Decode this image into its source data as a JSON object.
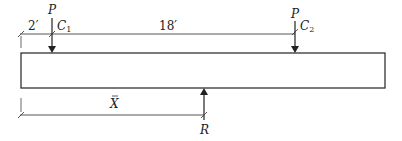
{
  "diagram": {
    "type": "beam-free-body",
    "loads": [
      {
        "id": "P1",
        "label": "P",
        "point": "C",
        "subscript": "1"
      },
      {
        "id": "P2",
        "label": "P",
        "point": "C",
        "subscript": "2"
      }
    ],
    "reaction": {
      "label": "R"
    },
    "dimensions": {
      "left_offset": "2′",
      "between_loads": "18′",
      "resultant_distance": "X"
    },
    "colors": {
      "line": "#333333",
      "background": "#ffffff"
    }
  }
}
